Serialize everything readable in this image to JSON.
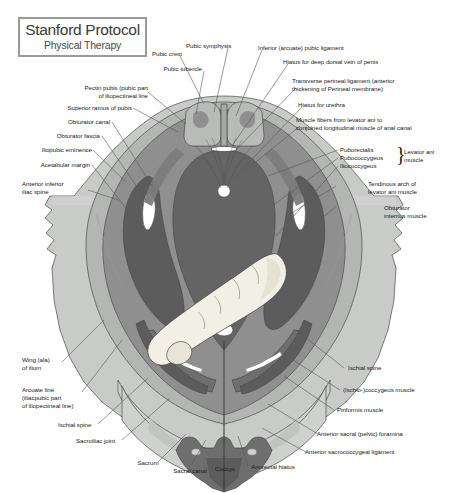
{
  "logo": {
    "title": "Stanford Protocol",
    "subtitle": "Physical Therapy",
    "border_color": "#9a9a9a"
  },
  "figure": {
    "name": "pelvic-floor-axial-cross-section",
    "palette": {
      "background": "#ffffff",
      "bone_light": "#c9cbc9",
      "bone_mid": "#b4b6b4",
      "muscle_mid": "#8e8f8e",
      "muscle_dark": "#6d6e6d",
      "muscle_darkest": "#5b5c5b",
      "cavity_dark": "#636463",
      "finger": "#f2efe4",
      "hiatus_white": "#ffffff",
      "outline": "#3a3a3a",
      "leader_line": "#55575a"
    }
  },
  "labels": {
    "top": [
      {
        "id": "pubic-crest",
        "text": "Pubic crest"
      },
      {
        "id": "pubic-symphysis",
        "text": "Pubic symphysis"
      },
      {
        "id": "inferior-arcuate-pubic-ligament",
        "text": "Inferior (arcuate) pubic ligament"
      },
      {
        "id": "pubic-tubercle",
        "text": "Pubic tubercle"
      },
      {
        "id": "hiatus-deep-dorsal-vein-penis",
        "text": "Hiatus for deep dorsal vein of penis"
      },
      {
        "id": "transverse-perineal-ligament",
        "text": "Transverse perineal ligament (anterior\nthickening of Perineal membrane)"
      },
      {
        "id": "hiatus-for-urethra",
        "text": "Hiatus for urethra"
      },
      {
        "id": "muscle-fibers-levator-ani",
        "text": "Muscle fibers from levator ani to\nconjoined longitudinal muscle of anal canal"
      }
    ],
    "left": [
      {
        "id": "pectin-pubis",
        "text": "Pectin pubis (pubic part\nof iliopectineal line"
      },
      {
        "id": "superior-ramus-of-pubis",
        "text": "Superior ramus of pubis"
      },
      {
        "id": "obturator-canal",
        "text": "Obturator canal"
      },
      {
        "id": "obturator-fascia",
        "text": "Obturator fascia"
      },
      {
        "id": "iliopubic-eminence",
        "text": "Iliopubic eminence"
      },
      {
        "id": "acetabular-margin",
        "text": "Acetabular margin"
      },
      {
        "id": "anterior-inferior-iliac-spine",
        "text": "Anterior inferior\niliac spine"
      },
      {
        "id": "wing-ala-of-ilium",
        "text": "Wing (ala)\nof ilium"
      },
      {
        "id": "arcuate-line",
        "text": "Arcuate line\n(iliacpubic part\nof iliopectineal line)"
      },
      {
        "id": "ischial-spine-left",
        "text": "Ischial spine"
      },
      {
        "id": "sacroiliac-joint",
        "text": "Sacroiliac joint"
      }
    ],
    "right": [
      {
        "id": "puborectalis",
        "text": "Puborectalis"
      },
      {
        "id": "pubococcygeus",
        "text": "Pubococcygeus"
      },
      {
        "id": "iliococcygeus",
        "text": "Iliococcygeus"
      },
      {
        "id": "levator-ani-muscle",
        "text": "Levator ani\nmuscle"
      },
      {
        "id": "tendinous-arch-levator-ani",
        "text": "Tendinous arch of\nlevator ani muscle"
      },
      {
        "id": "obturator-internus-muscle",
        "text": "Obturator\ninternus muscle"
      },
      {
        "id": "ischial-spine-right",
        "text": "Ischial spine"
      },
      {
        "id": "ischio-coccygeus-muscle",
        "text": "(Ischio-)coccygeus muscle"
      },
      {
        "id": "piriformis-muscle",
        "text": "Piriformis muscle"
      },
      {
        "id": "anterior-sacral-pelvic-foramina",
        "text": "Anterior sacral (pelvic) foramina"
      },
      {
        "id": "anterior-sacrococcygeal-ligament",
        "text": "Anterior sacrococcygeal ligament"
      }
    ],
    "bottom": [
      {
        "id": "sacrum",
        "text": "Sacrum"
      },
      {
        "id": "sacral-canal",
        "text": "Sacral canal"
      },
      {
        "id": "coccyx",
        "text": "Coccyx"
      },
      {
        "id": "anorectal-hiatus",
        "text": "Anorectal hiatus"
      }
    ],
    "brace_glyph": "}"
  }
}
